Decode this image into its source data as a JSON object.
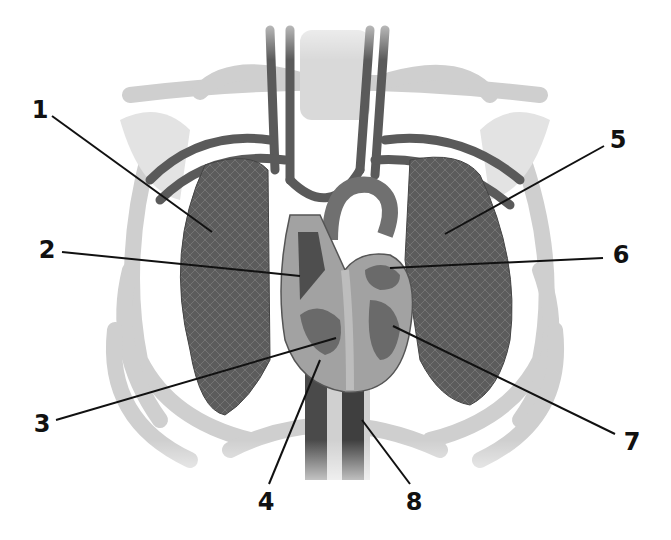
{
  "figure": {
    "labels": [
      {
        "id": "1",
        "text": "1",
        "x": 40,
        "y": 110,
        "line": [
          52,
          116,
          212,
          232
        ],
        "target": "right lung"
      },
      {
        "id": "2",
        "text": "2",
        "x": 47,
        "y": 250,
        "line": [
          62,
          252,
          300,
          276
        ],
        "target": "right atrium"
      },
      {
        "id": "3",
        "text": "3",
        "x": 42,
        "y": 424,
        "line": [
          56,
          420,
          336,
          338
        ],
        "target": "right ventricle"
      },
      {
        "id": "4",
        "text": "4",
        "x": 266,
        "y": 502,
        "line": [
          269,
          484,
          320,
          360
        ],
        "target": "inferior vena cava / septum base"
      },
      {
        "id": "5",
        "text": "5",
        "x": 618,
        "y": 140,
        "line": [
          604,
          146,
          445,
          234
        ],
        "target": "left lung"
      },
      {
        "id": "6",
        "text": "6",
        "x": 621,
        "y": 255,
        "line": [
          603,
          258,
          390,
          268
        ],
        "target": "left atrium"
      },
      {
        "id": "7",
        "text": "7",
        "x": 632,
        "y": 442,
        "line": [
          615,
          434,
          393,
          326
        ],
        "target": "left ventricle"
      },
      {
        "id": "8",
        "text": "8",
        "x": 414,
        "y": 502,
        "line": [
          410,
          484,
          362,
          420
        ],
        "target": "descending aorta"
      }
    ]
  },
  "colors": {
    "background": "#ffffff",
    "label_text": "#111111",
    "leader_line": "#111111",
    "lung": "#5a5a5a",
    "rib": "#d4d4d4",
    "vessel": "#555555",
    "heart_wall": "#9a9a9a",
    "heart_chamber": "#6a6a6a"
  }
}
